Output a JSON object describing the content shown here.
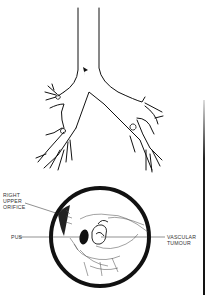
{
  "figure": {
    "type": "medical illustration",
    "colors": {
      "ink": "#111111",
      "background": "#ffffff",
      "label_text": "#333333"
    }
  },
  "upper_diagram": {
    "name": "trachea and bronchial tree",
    "marker": "arrowhead at carina"
  },
  "lower_diagram": {
    "name": "bronchoscopic circular view",
    "labels": {
      "right_upper_orifice": "RIGHT\nUPPER\nORIFICE",
      "pus": "PUS",
      "vascular_tumour": "VASCULAR\nTUMOUR"
    }
  }
}
